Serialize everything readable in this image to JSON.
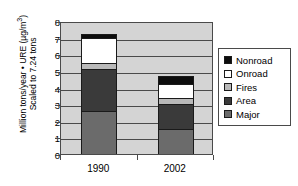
{
  "chart_data": {
    "type": "bar",
    "subtype": "stacked-bar",
    "title": "",
    "xlabel": "",
    "ylabel_line1": "Million tons/year • URE (µg/m³)",
    "ylabel_line2": "Scaled to 7.24 tons",
    "categories": [
      "1990",
      "2002"
    ],
    "ylim": [
      0,
      8
    ],
    "ytick_labels": [
      "0",
      "1",
      "2",
      "3",
      "4",
      "5",
      "6",
      "7",
      "8"
    ],
    "ytick_values": [
      0,
      1,
      2,
      3,
      4,
      5,
      6,
      7,
      8
    ],
    "grid": true,
    "legend_position": "right",
    "stack_order_bottom_to_top": [
      "Major",
      "Area",
      "Fires",
      "Onroad",
      "Nonroad"
    ],
    "series": [
      {
        "name": "Major",
        "color": "#6b6b6b",
        "values": [
          2.6,
          1.5
        ]
      },
      {
        "name": "Area",
        "color": "#3a3a3a",
        "values": [
          2.5,
          1.5
        ]
      },
      {
        "name": "Fires",
        "color": "#b9b9b9",
        "values": [
          0.4,
          0.35
        ]
      },
      {
        "name": "Onroad",
        "color": "#ffffff",
        "values": [
          1.45,
          0.85
        ]
      },
      {
        "name": "Nonroad",
        "color": "#0d0d0d",
        "values": [
          0.29,
          0.5
        ]
      }
    ],
    "totals": [
      7.24,
      4.7
    ]
  },
  "legend": {
    "items": [
      {
        "label": "Nonroad",
        "color": "#0d0d0d"
      },
      {
        "label": "Onroad",
        "color": "#ffffff"
      },
      {
        "label": "Fires",
        "color": "#b9b9b9"
      },
      {
        "label": "Area",
        "color": "#3a3a3a"
      },
      {
        "label": "Major",
        "color": "#6b6b6b"
      }
    ]
  }
}
